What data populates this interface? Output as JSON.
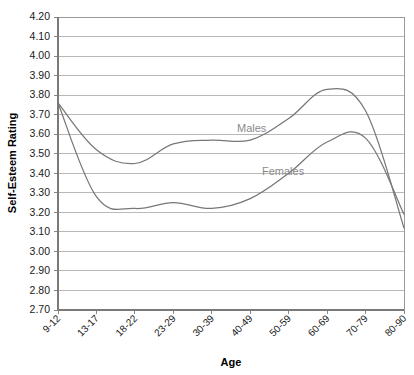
{
  "chart_data": {
    "type": "line",
    "title": "",
    "xlabel": "Age",
    "ylabel": "Self-Esteem Rating",
    "ylim": [
      2.7,
      4.2
    ],
    "ytick_step": 0.1,
    "grid": true,
    "legend": "inline-labels",
    "categories": [
      "9-12",
      "13-17",
      "18-22",
      "23-29",
      "30-39",
      "40-49",
      "50-59",
      "60-69",
      "70-79",
      "80-90"
    ],
    "ytick_labels": [
      "4.20",
      "4.10",
      "4.00",
      "3.90",
      "3.80",
      "3.70",
      "3.60",
      "3.50",
      "3.40",
      "3.30",
      "3.20",
      "3.10",
      "3.00",
      "2.90",
      "2.80",
      "2.70"
    ],
    "series": [
      {
        "name": "Males",
        "color": "#777777",
        "label_position": "inline",
        "values": [
          3.76,
          3.52,
          3.45,
          3.55,
          3.57,
          3.57,
          3.68,
          3.83,
          3.72,
          3.12
        ]
      },
      {
        "name": "Females",
        "color": "#777777",
        "label_position": "inline",
        "values": [
          3.76,
          3.28,
          3.22,
          3.25,
          3.22,
          3.27,
          3.4,
          3.56,
          3.58,
          3.19
        ]
      }
    ],
    "annotations": [
      {
        "text": "Males",
        "near_category": "40-49",
        "value": 3.63
      },
      {
        "text": "Females",
        "near_category": "55",
        "value": 3.44
      }
    ]
  },
  "axis": {
    "y_label": "Self-Esteem Rating",
    "x_label": "Age"
  }
}
